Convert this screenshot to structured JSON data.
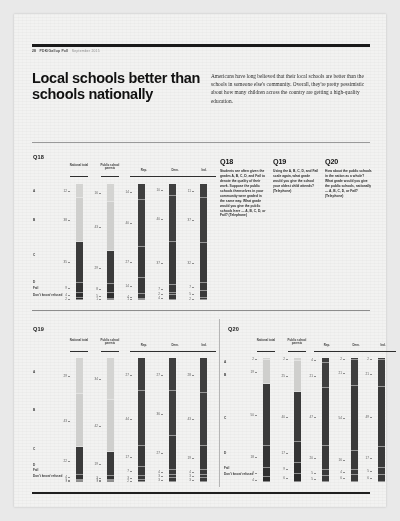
{
  "meta": {
    "running_head": {
      "page_number": "28",
      "publication": "PDK/Gallup Poll",
      "issue": "September 2015"
    }
  },
  "headline": "Local schools better than schools nationally",
  "standfirst": "Americans have long believed that their local schools are better than the schools in someone else's community. Overall, they're pretty pessimistic about how many children across the country are getting a high-quality education.",
  "questions": [
    {
      "id": "Q18",
      "number": "Q18",
      "text": "Students are often given the grades A, B, C, D, and Fail to denote the quality of their work. Suppose the public schools themselves in your community were graded in the same way. What grade would you give the public schools here — A, B, C, D, or Fail? (Telephone)"
    },
    {
      "id": "Q19",
      "number": "Q19",
      "text": "Using the A, B, C, D, and Fail scale again, what grade would you give the school your oldest child attends? (Telephone)"
    },
    {
      "id": "Q20",
      "number": "Q20",
      "text": "How about the public schools in the nation as a whole? What grade would you give the public schools, nationally — A, B, C, D, or Fail? (Telephone)"
    }
  ],
  "chart_data": [
    {
      "id": "chart-q18",
      "type": "bar",
      "title": "Q18",
      "subtype": "stacked-100",
      "categories": [
        "National total",
        "Public school parents",
        "Rep.",
        "Dem.",
        "Ind."
      ],
      "row_labels": [
        "A",
        "B",
        "C",
        "D",
        "Fail",
        "Don't know/ refused"
      ],
      "series": [
        {
          "name": "A",
          "values": [
            12,
            16,
            14,
            10,
            11
          ]
        },
        {
          "name": "B",
          "values": [
            38,
            43,
            40,
            40,
            37
          ]
        },
        {
          "name": "C",
          "values": [
            35,
            29,
            27,
            37,
            32
          ]
        },
        {
          "name": "D",
          "values": [
            9,
            8,
            14,
            7,
            7
          ]
        },
        {
          "name": "Fail",
          "values": [
            4,
            5,
            4,
            2,
            5
          ]
        },
        {
          "name": "Don't know/ refused",
          "values": [
            2,
            1,
            1,
            4,
            2
          ]
        }
      ],
      "ylabel": "",
      "xlabel": "",
      "grid": false,
      "legend": "none",
      "note": "Values shown as percentages beside each stacked bar segment."
    },
    {
      "id": "chart-q19",
      "type": "bar",
      "title": "Q19",
      "subtype": "stacked-100",
      "categories": [
        "National total",
        "Public school parents",
        "Rep.",
        "Dem.",
        "Ind."
      ],
      "row_labels": [
        "A",
        "B",
        "C",
        "D",
        "Fail",
        "Don't know/ refused"
      ],
      "series": [
        {
          "name": "A",
          "values": [
            29,
            34,
            27,
            27,
            28
          ]
        },
        {
          "name": "B",
          "values": [
            43,
            42,
            44,
            36,
            43
          ]
        },
        {
          "name": "C",
          "values": [
            22,
            19,
            17,
            27,
            19
          ]
        },
        {
          "name": "D",
          "values": [
            4,
            3,
            7,
            4,
            4
          ]
        },
        {
          "name": "Fail",
          "values": [
            1,
            1,
            3,
            3,
            3
          ]
        },
        {
          "name": "Don't know/ refused",
          "values": [
            1,
            1,
            2,
            3,
            3
          ]
        }
      ],
      "ylabel": "",
      "xlabel": "",
      "grid": false,
      "legend": "none",
      "note": "Values shown as percentages beside each stacked bar segment."
    },
    {
      "id": "chart-q20",
      "type": "bar",
      "title": "Q20",
      "subtype": "stacked-100",
      "categories": [
        "National total",
        "Public school parents",
        "Rep.",
        "Dem.",
        "Ind."
      ],
      "row_labels": [
        "A",
        "B",
        "C",
        "D",
        "Fail",
        "Don't know/ refused"
      ],
      "series": [
        {
          "name": "A",
          "values": [
            2,
            2,
            4,
            2,
            2
          ]
        },
        {
          "name": "B",
          "values": [
            19,
            25,
            21,
            21,
            21
          ]
        },
        {
          "name": "C",
          "values": [
            50,
            40,
            47,
            54,
            49
          ]
        },
        {
          "name": "D",
          "values": [
            18,
            17,
            20,
            16,
            17
          ]
        },
        {
          "name": "Fail",
          "values": [
            7,
            9,
            5,
            4,
            5
          ]
        },
        {
          "name": "Don't know/ refused",
          "values": [
            4,
            6,
            5,
            6,
            6
          ]
        }
      ],
      "ylabel": "",
      "xlabel": "",
      "grid": false,
      "legend": "none",
      "note": "Values shown as percentages beside each stacked bar segment."
    }
  ],
  "colors": {
    "segment_a": "#d4d4d2",
    "segment_b": "#cfcfcd",
    "segment_c": "#3b3b3b",
    "segment_d": "#343434",
    "segment_fail": "#2f2f2f",
    "segment_dk": "#2b2b2b",
    "partisan_bar": "#3a3a3a",
    "rule": "#1f1f1f",
    "paper": "#f2f2f1"
  }
}
